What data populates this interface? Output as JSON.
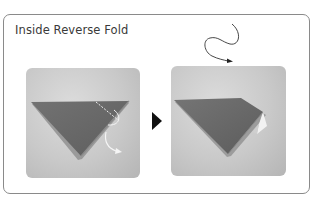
{
  "diagram": {
    "title": "Inside Reverse Fold",
    "steps": [
      {
        "id": "step-1",
        "description": "Folded triangle with valley-fold dotted line near right tip and curved arrows showing the reverse fold",
        "annotations": [
          "dotted-fold-line",
          "curved-fold-arrow",
          "push-in-arrow"
        ]
      },
      {
        "id": "step-2",
        "description": "Result: right tip reversed inside the triangle",
        "annotations": [
          "squiggle-turn-arrow"
        ]
      }
    ],
    "connector": "next-step-arrow",
    "colors": {
      "border": "#8a8a8a",
      "paper": "#6e6e6e",
      "background_photo": "#cccccc",
      "arrow": "#111111"
    }
  }
}
